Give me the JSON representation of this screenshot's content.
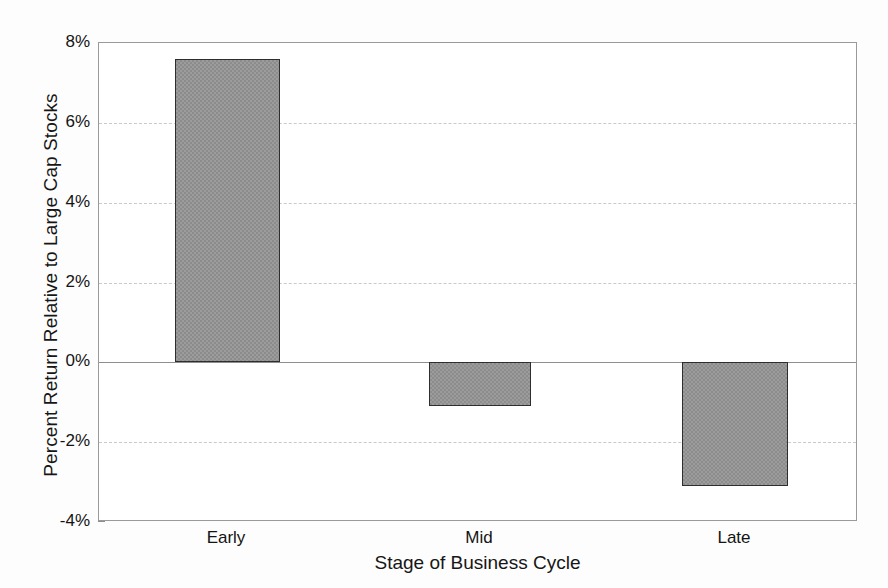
{
  "chart_data": {
    "type": "bar",
    "title": "",
    "xlabel": "Stage of Business Cycle",
    "ylabel": "Percent Return Relative to Large Cap Stocks",
    "categories": [
      "Early",
      "Mid",
      "Late"
    ],
    "values": [
      7.6,
      -1.1,
      -3.1
    ],
    "value_labels": [
      "7.6%",
      "-1.1%",
      "-3.1%"
    ],
    "ylim": [
      -4,
      8
    ],
    "ytick_labels": [
      "8%",
      "6%",
      "4%",
      "2%",
      "0%",
      "-2%",
      "-4%"
    ],
    "ytick_values": [
      8,
      6,
      4,
      2,
      0,
      -2,
      -4
    ],
    "xtick_labels": [
      "Early",
      "Mid",
      "Late"
    ],
    "grid": true,
    "grid_style": "dashed",
    "legend": "none",
    "series": [
      {
        "name": "Percent Return Relative to Large Cap Stocks",
        "values": [
          7.6,
          -1.1,
          -3.1
        ]
      }
    ],
    "colors": {
      "bar_fill": "#8c8c8c",
      "bar_edge": "#2e2e2e",
      "grid": "#c9c9c9",
      "axis": "#9a9a9a",
      "zero_line": "#8e8e8e",
      "text": "#141414",
      "background": "#ffffff"
    }
  }
}
